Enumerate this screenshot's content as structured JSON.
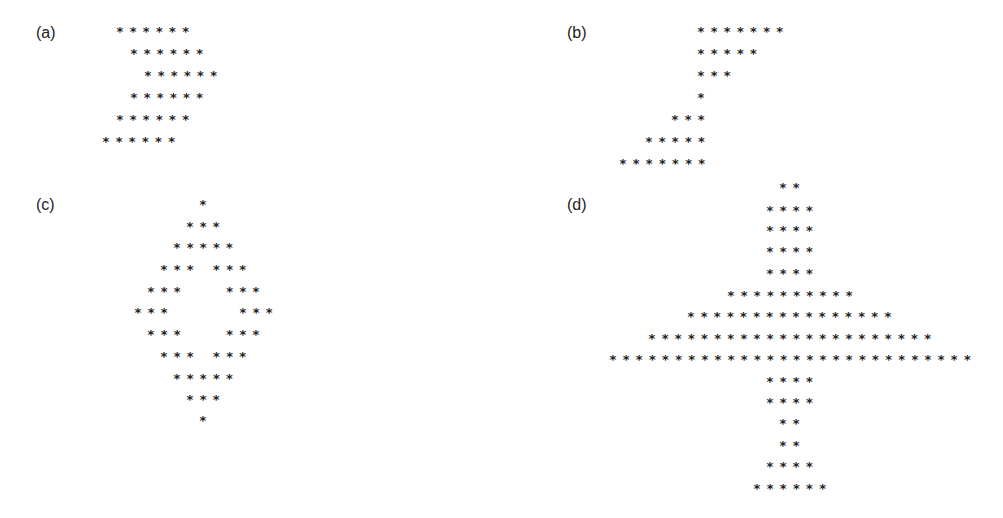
{
  "panels": [
    {
      "label": "(a)",
      "rows": [
        {
          "text": "******",
          "x": 116,
          "y": 22
        },
        {
          "text": "******",
          "x": 130,
          "y": 44
        },
        {
          "text": "******",
          "x": 144,
          "y": 66
        },
        {
          "text": "******",
          "x": 130,
          "y": 88
        },
        {
          "text": "******",
          "x": 116,
          "y": 110
        },
        {
          "text": "******",
          "x": 102,
          "y": 132
        }
      ]
    },
    {
      "label": "(b)",
      "rows": [
        {
          "text": "*******",
          "x": 697,
          "y": 22
        },
        {
          "text": "*****",
          "x": 697,
          "y": 44
        },
        {
          "text": "***",
          "x": 697,
          "y": 66
        },
        {
          "text": "*",
          "x": 697,
          "y": 88
        },
        {
          "text": "***",
          "x": 671,
          "y": 110
        },
        {
          "text": "*****",
          "x": 645,
          "y": 132
        },
        {
          "text": "*******",
          "x": 619,
          "y": 154
        }
      ]
    },
    {
      "label": "(c)",
      "rows": [
        {
          "text": "*",
          "x": 199,
          "y": 195
        },
        {
          "text": "***",
          "x": 186,
          "y": 217
        },
        {
          "text": "*****",
          "x": 173,
          "y": 238
        },
        {
          "text": "*** ***",
          "x": 160,
          "y": 260
        },
        {
          "text": "***   ***",
          "x": 147,
          "y": 282
        },
        {
          "text": "***     ***",
          "x": 134,
          "y": 303
        },
        {
          "text": "***   ***",
          "x": 147,
          "y": 325
        },
        {
          "text": "*** ***",
          "x": 160,
          "y": 347
        },
        {
          "text": "*****",
          "x": 173,
          "y": 369
        },
        {
          "text": "***",
          "x": 186,
          "y": 390
        },
        {
          "text": "*",
          "x": 199,
          "y": 411
        }
      ]
    },
    {
      "label": "(d)",
      "rows": [
        {
          "text": "**",
          "x": 779,
          "y": 178
        },
        {
          "text": "****",
          "x": 766,
          "y": 201
        },
        {
          "text": "****",
          "x": 766,
          "y": 221
        },
        {
          "text": "****",
          "x": 766,
          "y": 242
        },
        {
          "text": "****",
          "x": 766,
          "y": 264
        },
        {
          "text": "**********",
          "x": 727,
          "y": 286
        },
        {
          "text": "****************",
          "x": 687,
          "y": 307
        },
        {
          "text": "**********************",
          "x": 648,
          "y": 329
        },
        {
          "text": "****************************",
          "x": 609,
          "y": 350
        },
        {
          "text": "****",
          "x": 766,
          "y": 372
        },
        {
          "text": "****",
          "x": 766,
          "y": 393
        },
        {
          "text": "**",
          "x": 779,
          "y": 414
        },
        {
          "text": "**",
          "x": 779,
          "y": 436
        },
        {
          "text": "****",
          "x": 766,
          "y": 457
        },
        {
          "text": "******",
          "x": 753,
          "y": 479
        }
      ]
    }
  ],
  "labels_pos": [
    {
      "x": 36,
      "y": 24
    },
    {
      "x": 567,
      "y": 24
    },
    {
      "x": 36,
      "y": 196
    },
    {
      "x": 567,
      "y": 196
    }
  ]
}
